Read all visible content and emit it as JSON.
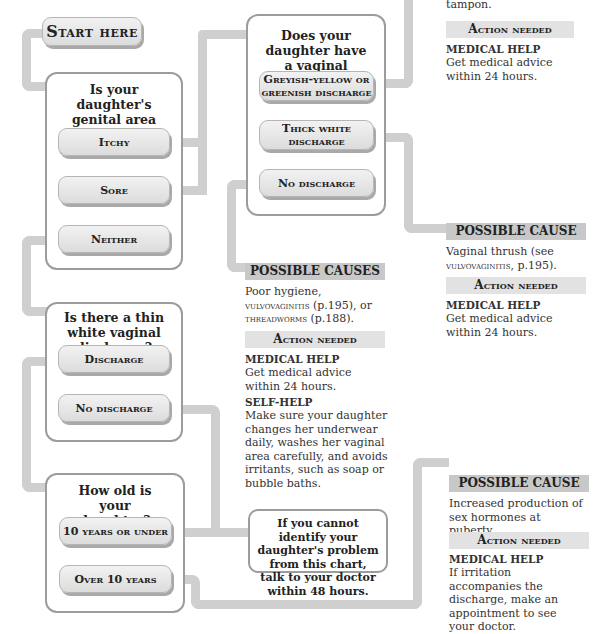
{
  "top_fragments": {
    "left_cut_text": "...",
    "right_cut_text": "tampon."
  },
  "start": {
    "label": "Start here"
  },
  "q1": {
    "question": "Is your daughter's genital area itchy or uncomfortable?",
    "options": [
      "Itchy",
      "Sore",
      "Neither"
    ]
  },
  "q2": {
    "question": "Does your daughter have a vaginal discharge?",
    "options": [
      "Greyish-yellow or greenish discharge",
      "Thick white discharge",
      "No discharge"
    ]
  },
  "q3": {
    "question": "Is there a thin white vaginal discharge?",
    "options": [
      "Discharge",
      "No discharge"
    ]
  },
  "q4": {
    "question": "How old is your daughter?",
    "options": [
      "10 years or under",
      "Over 10 years"
    ]
  },
  "result_top": {
    "action_header": "Action needed",
    "help_label": "MEDICAL HELP",
    "help_text": "Get medical advice within 24 hours."
  },
  "result_thrush": {
    "cause_header": "POSSIBLE CAUSE",
    "cause_text_1": "Vaginal thrush (see ",
    "cause_ref": "vulvovaginitis",
    "cause_text_2": ", p.195).",
    "action_header": "Action needed",
    "help_label": "MEDICAL HELP",
    "help_text": "Get medical advice within 24 hours."
  },
  "result_hygiene": {
    "cause_header": "POSSIBLE CAUSES",
    "cause_text_1": "Poor hygiene, ",
    "cause_ref_1": "vulvovaginitis",
    "cause_text_2": " (p.195), or ",
    "cause_ref_2": "threadworms",
    "cause_text_3": " (p.188).",
    "action_header": "Action needed",
    "help_label": "MEDICAL HELP",
    "help_text": "Get medical advice within 24 hours.",
    "self_help_label": "SELF-HELP",
    "self_help_text": "Make sure your daughter changes her underwear daily, washes her vaginal area carefully, and avoids irritants, such as soap or bubble baths."
  },
  "result_puberty": {
    "cause_header": "POSSIBLE CAUSE",
    "cause_text": "Increased production of sex hormones at puberty.",
    "action_header": "Action needed",
    "help_label": "MEDICAL HELP",
    "help_text": "If irritation accompanies the discharge, make an appointment to see your doctor."
  },
  "fallback_note": {
    "text": "If you cannot identify your daughter's problem from this chart, talk to your doctor within 48 hours."
  },
  "colors": {
    "connector": "#cfcfcf",
    "box_border": "#9c9c9c",
    "header_dark": "#c8c8c8",
    "header_light": "#e2e2e2"
  }
}
